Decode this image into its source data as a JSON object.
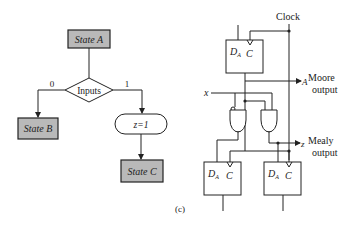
{
  "asm_chart": {
    "state_a": "State A",
    "decision": "Inputs",
    "branch_0": "0",
    "branch_1": "1",
    "state_b": "State B",
    "conditional_output": "z=1",
    "state_c": "State C"
  },
  "circuit": {
    "clock_label": "Clock",
    "input_label": "x",
    "ff_top": {
      "d": "D",
      "sub": "A",
      "c": "C"
    },
    "ff_bottom_left": {
      "d": "D",
      "sub": "A",
      "c": "C"
    },
    "ff_bottom_right": {
      "d": "D",
      "sub": "A",
      "c": "C"
    },
    "moore": {
      "signal": "A",
      "line1": "Moore",
      "line2": "output"
    },
    "mealy": {
      "signal": "z",
      "line1": "Mealy",
      "line2": "output"
    }
  },
  "caption": "(c)",
  "colors": {
    "state_fill": "#b9b9b9",
    "line": "#222222",
    "background": "#ffffff"
  }
}
